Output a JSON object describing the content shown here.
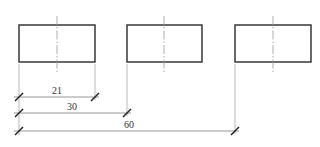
{
  "drawing": {
    "type": "dimensioned rectangles (baseline dimensioning)",
    "rectangles": [
      {
        "id": "rect-1",
        "x": 19,
        "y": 25,
        "w": 76,
        "h": 37,
        "center_x": 57
      },
      {
        "id": "rect-2",
        "x": 127,
        "y": 25,
        "w": 75,
        "h": 37,
        "center_x": 164
      },
      {
        "id": "rect-3",
        "x": 235,
        "y": 25,
        "w": 76,
        "h": 37,
        "center_x": 273
      }
    ],
    "dimensions": [
      {
        "label": "21",
        "x1": 19,
        "x2": 95,
        "y": 97,
        "text_x": 57,
        "text_y": 93
      },
      {
        "label": "30",
        "x1": 19,
        "x2": 127,
        "y": 113,
        "text_x": 72,
        "text_y": 109
      },
      {
        "label": "60",
        "x1": 19,
        "x2": 235,
        "y": 131,
        "text_x": 129,
        "text_y": 127
      }
    ]
  }
}
